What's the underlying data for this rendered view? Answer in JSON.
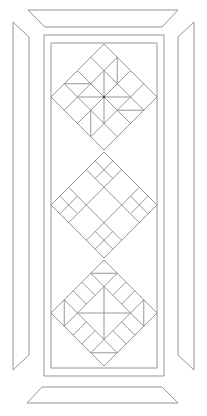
{
  "diagram": {
    "title": "Quilt table runner line pattern",
    "stroke_color": "#8a8a8a",
    "background": "#ffffff",
    "frame": {
      "top_border": [
        [
          28,
          10
        ],
        [
          178,
          10
        ],
        [
          162,
          27
        ],
        [
          45,
          27
        ]
      ],
      "bottom_border": [
        [
          42,
          387
        ],
        [
          162,
          387
        ],
        [
          178,
          403
        ],
        [
          27,
          403
        ]
      ],
      "left_border": [
        [
          13,
          22
        ],
        [
          29,
          37
        ],
        [
          29,
          355
        ],
        [
          13,
          370
        ]
      ],
      "right_border": [
        [
          194,
          22
        ],
        [
          178,
          37
        ],
        [
          178,
          355
        ],
        [
          194,
          370
        ]
      ],
      "outer_rect": {
        "x": 44,
        "y": 35,
        "w": 120,
        "h": 341
      },
      "inner_rect": {
        "x": 51,
        "y": 43,
        "w": 106,
        "h": 325
      }
    },
    "blocks": [
      {
        "name": "pinwheel-block",
        "top": [
          104,
          44
        ],
        "size": 53
      },
      {
        "name": "nine-patch-block",
        "top": [
          104,
          152
        ],
        "size": 53
      },
      {
        "name": "rail-hourglass-block",
        "top": [
          104,
          260
        ],
        "size": 53
      }
    ]
  }
}
